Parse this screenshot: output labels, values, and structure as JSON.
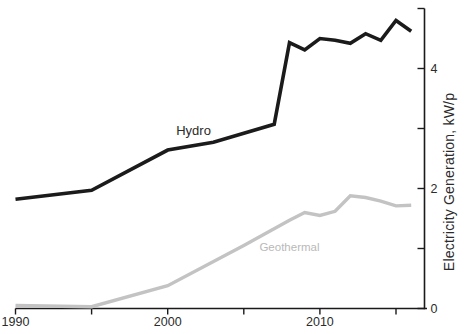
{
  "figure": {
    "background": "#ffffff"
  },
  "chart_data": {
    "type": "line",
    "title": "",
    "xlabel": "",
    "ylabel": "Electricity Generation, kW/p",
    "xlim": [
      1990,
      2017
    ],
    "ylim": [
      0,
      5
    ],
    "grid": false,
    "y_axis_side": "right",
    "legend_position": "inline-line-labels",
    "axis_color": "#1a1a1a",
    "tick_label_color": "#2b2b2b",
    "x_ticks": [
      {
        "value": 1990,
        "label": "1990"
      },
      {
        "value": 1995,
        "label": ""
      },
      {
        "value": 2000,
        "label": "2000"
      },
      {
        "value": 2005,
        "label": ""
      },
      {
        "value": 2010,
        "label": "2010"
      },
      {
        "value": 2015,
        "label": ""
      }
    ],
    "y_ticks": [
      {
        "value": 0,
        "label": "0"
      },
      {
        "value": 1,
        "label": ""
      },
      {
        "value": 2,
        "label": "2"
      },
      {
        "value": 3,
        "label": ""
      },
      {
        "value": 4,
        "label": "4"
      },
      {
        "value": 5,
        "label": ""
      }
    ],
    "series": [
      {
        "name": "Hydro",
        "label": "Hydro",
        "color": "#1b1b1b",
        "label_color": "#2a2a2a",
        "label_anchor": {
          "year": 2001.7,
          "value": 2.97
        },
        "x": [
          1990,
          1995,
          2000,
          2003,
          2007,
          2008,
          2009,
          2010,
          2011,
          2012,
          2013,
          2014,
          2015,
          2016
        ],
        "values": [
          1.82,
          1.97,
          2.64,
          2.77,
          3.07,
          4.43,
          4.31,
          4.5,
          4.47,
          4.42,
          4.58,
          4.47,
          4.8,
          4.62
        ]
      },
      {
        "name": "Geothermal",
        "label": "Geothermal",
        "color": "#c3c3c3",
        "label_color": "#b9b9b9",
        "label_anchor": {
          "year": 2008.0,
          "value": 1.02
        },
        "x": [
          1990,
          1995,
          2000,
          2005,
          2008,
          2009,
          2010,
          2011,
          2012,
          2013,
          2014,
          2015,
          2016
        ],
        "values": [
          0.05,
          0.03,
          0.38,
          1.05,
          1.47,
          1.6,
          1.55,
          1.62,
          1.88,
          1.85,
          1.79,
          1.71,
          1.72
        ]
      }
    ]
  }
}
